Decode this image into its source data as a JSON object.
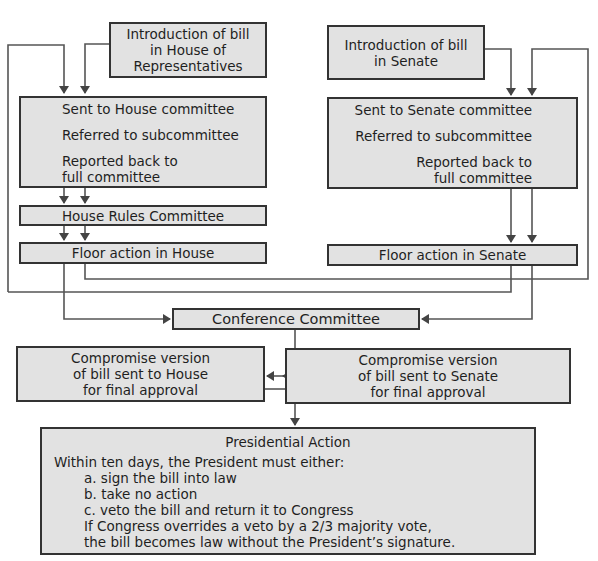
{
  "house": {
    "introduction": [
      "Introduction of bill",
      "in House of",
      "Representatives"
    ],
    "committee_steps": [
      "Sent to House committee",
      "Referred to subcommittee",
      "Reported back to",
      "full committee"
    ],
    "rules_committee": "House Rules Committee",
    "floor_action": "Floor action in House"
  },
  "senate": {
    "introduction": [
      "Introduction of bill",
      "in Senate"
    ],
    "committee_steps": [
      "Sent to Senate committee",
      "Referred to subcommittee",
      "Reported back to",
      "full committee"
    ],
    "floor_action": "Floor action in Senate"
  },
  "conference": {
    "label": "Conference Committee"
  },
  "compromise": {
    "house": [
      "Compromise version",
      "of bill sent to House",
      "for final approval"
    ],
    "senate": [
      "Compromise version",
      "of bill sent to Senate",
      "for final approval"
    ]
  },
  "presidential": {
    "title": "Presidential Action",
    "intro": "Within ten days, the President must either:",
    "options": [
      "a. sign the bill into law",
      "b. take no action",
      "c. veto the bill and return it to Congress"
    ],
    "override": [
      "If Congress overrides a veto by a 2/3 majority vote,",
      "the bill becomes law without the President’s signature."
    ]
  },
  "colors": {
    "box_fill": "#e2e2e2",
    "box_border": "#333333",
    "connector": "#444444"
  }
}
